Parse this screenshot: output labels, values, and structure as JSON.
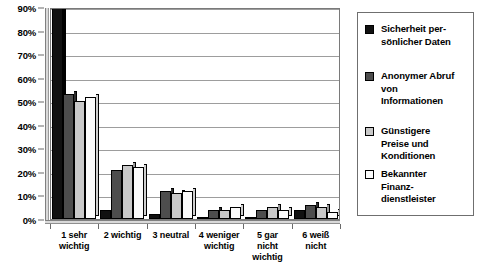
{
  "chart_data": {
    "type": "bar",
    "title": "",
    "subtitle": "",
    "xlabel": "",
    "ylabel": "",
    "ylim": [
      0,
      90
    ],
    "ytick_labels": [
      "90%",
      "80%",
      "70%",
      "60%",
      "50%",
      "40%",
      "30%",
      "20%",
      "10%",
      "0%"
    ],
    "ytick_values": [
      90,
      80,
      70,
      60,
      50,
      40,
      30,
      20,
      10,
      0
    ],
    "grid": true,
    "legend_position": "right",
    "categories": [
      "1 sehr\nwichtig",
      "2 wichtig",
      "3 neutral",
      "4 weniger\nwichtig",
      "5 gar\nnicht\nwichtig",
      "6 weiß\nnicht"
    ],
    "series": [
      {
        "name": "Sicherheit per-\nsönlicher Daten",
        "color": "#111111",
        "values": [
          95,
          4,
          2,
          1,
          1,
          4
        ]
      },
      {
        "name": "Anonymer Abruf\nvon\nInformationen",
        "color": "#4d4d4d",
        "values": [
          53,
          21,
          12,
          4,
          4,
          6
        ]
      },
      {
        "name": "Günstigere\nPreise und\nKonditionen",
        "color": "#c9c9c9",
        "values": [
          50,
          23,
          11,
          4,
          5,
          5
        ]
      },
      {
        "name": "Bekannter\nFinanz-\ndienstleister",
        "color": "#fbfbfb",
        "values": [
          52,
          22,
          12,
          5,
          4,
          3
        ]
      }
    ]
  }
}
